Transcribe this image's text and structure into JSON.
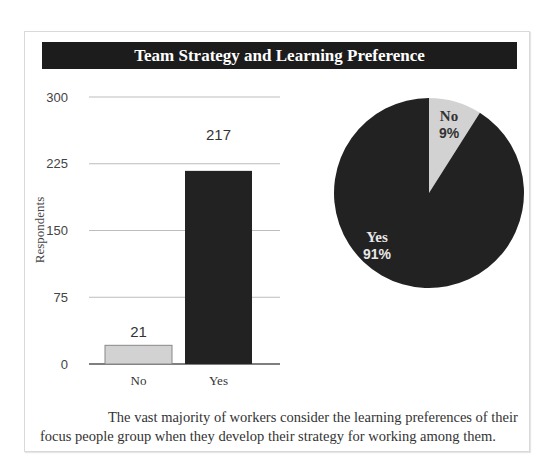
{
  "title": "Team Strategy and Learning Preference",
  "caption": "The vast majority of workers consider the learning preferences of their focus people group when they develop their strategy for working among them.",
  "colors": {
    "dark": "#222222",
    "light": "#d2d2d2",
    "grid": "#bdbdbd",
    "axis": "#555555"
  },
  "chart_data": [
    {
      "type": "bar",
      "title": "Team Strategy and Learning Preference",
      "xlabel": "",
      "ylabel": "Respondents",
      "categories": [
        "No",
        "Yes"
      ],
      "values": [
        21,
        217
      ],
      "data_labels": [
        "21",
        "217"
      ],
      "ylim": [
        0,
        300
      ],
      "yticks": [
        0,
        75,
        150,
        225,
        300
      ],
      "ytick_labels": [
        "0",
        "75",
        "150",
        "225",
        "300"
      ],
      "grid": true,
      "bar_colors": [
        "#d2d2d2",
        "#222222"
      ]
    },
    {
      "type": "pie",
      "categories": [
        "No",
        "Yes"
      ],
      "values": [
        9,
        91
      ],
      "labels": [
        {
          "name": "No",
          "pct": "9%"
        },
        {
          "name": "Yes",
          "pct": "91%"
        }
      ],
      "slice_colors": [
        "#d2d2d2",
        "#222222"
      ],
      "legend": "none"
    }
  ]
}
